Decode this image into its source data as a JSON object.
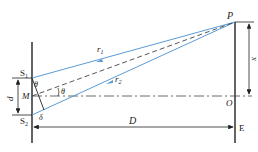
{
  "diagram": {
    "colors": {
      "ray": "#5b9bd5",
      "line": "#222222",
      "dash": "#444444"
    },
    "labels": {
      "P": "P",
      "S1": "S",
      "S1_sub": "1",
      "S2": "S",
      "S2_sub": "2",
      "M": "M",
      "O": "O",
      "E": "E",
      "D": "D",
      "d": "d",
      "x": "x",
      "r1": "r",
      "r1_sub": "1",
      "r2": "r",
      "r2_sub": "2",
      "theta_top": "θ",
      "theta_mid": "θ",
      "delta": "δ"
    }
  }
}
